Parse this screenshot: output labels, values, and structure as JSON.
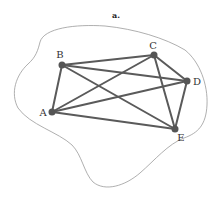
{
  "figure": {
    "title": "a.",
    "colors": {
      "edge": "#5a5a5a",
      "node": "#555555",
      "outline": "#9a9a9a",
      "text": "#333333"
    }
  },
  "graph": {
    "nodes": [
      {
        "id": "A",
        "label": "A",
        "x": 52,
        "y": 112
      },
      {
        "id": "B",
        "label": "B",
        "x": 62,
        "y": 65
      },
      {
        "id": "C",
        "label": "C",
        "x": 154,
        "y": 55
      },
      {
        "id": "D",
        "label": "D",
        "x": 187,
        "y": 81
      },
      {
        "id": "E",
        "label": "E",
        "x": 175,
        "y": 129
      }
    ],
    "edges": [
      [
        "A",
        "B"
      ],
      [
        "A",
        "C"
      ],
      [
        "A",
        "D"
      ],
      [
        "A",
        "E"
      ],
      [
        "B",
        "C"
      ],
      [
        "B",
        "D"
      ],
      [
        "B",
        "E"
      ],
      [
        "C",
        "D"
      ],
      [
        "C",
        "E"
      ],
      [
        "D",
        "E"
      ]
    ]
  }
}
